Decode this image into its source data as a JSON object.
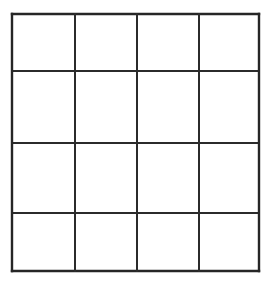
{
  "canvas": {
    "width": 275,
    "height": 283,
    "background_color": "#ffffff"
  },
  "figure": {
    "kind": "blank-grid",
    "title": "",
    "caption": "",
    "rows": 4,
    "columns": 4,
    "cell_count": 16,
    "cell_text": [
      [
        "",
        "",
        "",
        ""
      ],
      [
        "",
        "",
        "",
        ""
      ],
      [
        "",
        "",
        "",
        ""
      ],
      [
        "",
        "",
        "",
        ""
      ]
    ]
  },
  "style": {
    "line_color": "#2b2b2b",
    "line_color_outer": "#262626",
    "cell_fill": "#ffffff",
    "line_width": 2,
    "line_width_outer": 2.4
  },
  "geometry": {
    "x_lines": [
      12,
      75,
      137,
      199,
      259
    ],
    "y_lines": [
      14,
      71,
      143,
      213,
      271
    ],
    "column_widths": [
      63,
      62,
      62,
      60
    ],
    "row_heights": [
      57,
      72,
      70,
      58
    ]
  }
}
